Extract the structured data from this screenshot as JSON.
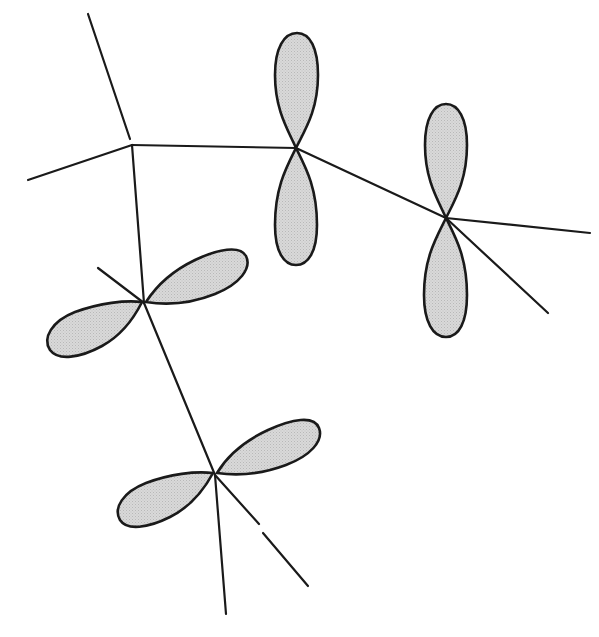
{
  "diagram": {
    "type": "p-orbital overlap on molecular skeleton",
    "colors": {
      "background": "#ffffff",
      "line": "#1a1a1a",
      "lobe_fill": "#d4d4d4"
    },
    "atoms": [
      {
        "id": "A",
        "x": 132,
        "y": 145,
        "has_orbital": false
      },
      {
        "id": "B",
        "x": 296,
        "y": 148,
        "has_orbital": true,
        "orbital_axis_deg": 90
      },
      {
        "id": "C",
        "x": 446,
        "y": 218,
        "has_orbital": true,
        "orbital_axis_deg": 90
      },
      {
        "id": "D",
        "x": 144,
        "y": 303,
        "has_orbital": true,
        "orbital_axis_deg": 25
      },
      {
        "id": "E",
        "x": 215,
        "y": 475,
        "has_orbital": true,
        "orbital_axis_deg": 28
      }
    ],
    "bonds": [
      {
        "from": "A",
        "to": "B"
      },
      {
        "from": "B",
        "to": "C"
      },
      {
        "from": "A",
        "to": "D"
      },
      {
        "from": "D",
        "to": "E"
      }
    ],
    "substituent_lines": [
      {
        "atom": "A",
        "x2": 88,
        "y2": 14
      },
      {
        "atom": "A",
        "x2": 28,
        "y2": 180
      },
      {
        "atom": "C",
        "x2": 590,
        "y2": 233
      },
      {
        "atom": "C",
        "x2": 548,
        "y2": 313
      },
      {
        "atom": "D",
        "x2": 98,
        "y2": 268
      },
      {
        "atom": "E",
        "x2": 226,
        "y2": 614
      },
      {
        "atom": "E",
        "x2": 308,
        "y2": 586
      }
    ],
    "orbital_count": 4
  }
}
